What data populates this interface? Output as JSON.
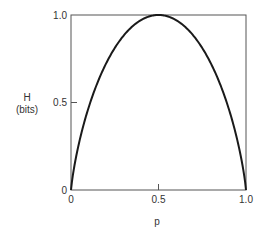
{
  "chart_data": {
    "type": "line",
    "title": "",
    "xlabel": "p",
    "ylabel_line1": "H",
    "ylabel_line2": "(bits)",
    "xlim": [
      0,
      1.0
    ],
    "ylim": [
      0,
      1.0
    ],
    "grid": false,
    "x_ticks": [
      {
        "value": 0,
        "label": "0"
      },
      {
        "value": 0.5,
        "label": "0.5"
      },
      {
        "value": 1.0,
        "label": "1.0"
      }
    ],
    "y_ticks": [
      {
        "value": 0,
        "label": "0"
      },
      {
        "value": 0.5,
        "label": "0.5"
      },
      {
        "value": 1.0,
        "label": "1.0"
      }
    ],
    "series": [
      {
        "name": "Binary entropy H(p)",
        "function": "-p*log2(p)-(1-p)*log2(1-p)",
        "x": [
          0,
          0.05,
          0.1,
          0.15,
          0.2,
          0.25,
          0.3,
          0.35,
          0.4,
          0.45,
          0.5,
          0.55,
          0.6,
          0.65,
          0.7,
          0.75,
          0.8,
          0.85,
          0.9,
          0.95,
          1.0
        ],
        "y": [
          0,
          0.286,
          0.469,
          0.61,
          0.722,
          0.811,
          0.881,
          0.934,
          0.971,
          0.993,
          1.0,
          0.993,
          0.971,
          0.934,
          0.881,
          0.811,
          0.722,
          0.61,
          0.469,
          0.286,
          0
        ],
        "color": "#1a1a1a"
      }
    ]
  }
}
